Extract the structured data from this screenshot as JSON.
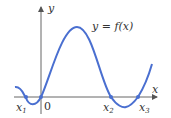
{
  "diagram": {
    "curve_label": "y = f(x)",
    "axes": {
      "x_label": "x",
      "y_label": "y",
      "origin_label": "0"
    },
    "roots": [
      {
        "label": "x",
        "sub": "1"
      },
      {
        "label": "x",
        "sub": "2"
      },
      {
        "label": "x",
        "sub": "3"
      }
    ],
    "colors": {
      "curve": "#4a6fd0",
      "axis": "#555555"
    }
  }
}
